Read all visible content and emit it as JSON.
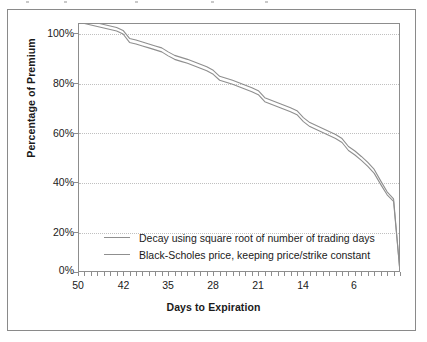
{
  "figure": {
    "border_color": "#8a8a8a",
    "background": "#ffffff"
  },
  "axes": {
    "y_title": "Percentage of Premium",
    "x_title": "Days to Expiration",
    "y_tick_labels": [
      "100%",
      "80%",
      "60%",
      "40%",
      "20%",
      "0%"
    ],
    "x_tick_labels": [
      "50",
      "42",
      "35",
      "28",
      "21",
      "14",
      "6"
    ],
    "grid_color": "#c0c0c0",
    "frame_color": "#8d8d8d"
  },
  "legend": {
    "items": [
      {
        "label": "Decay using square root of number of trading days",
        "color": "#8f8f8f"
      },
      {
        "label": "Black-Scholes price, keeping price/strike constant",
        "color": "#8f8f8f"
      }
    ]
  },
  "chart_data": {
    "type": "line",
    "title": "",
    "xlabel": "Days to Expiration",
    "ylabel": "Percentage of Premium",
    "xlim": [
      50,
      0
    ],
    "ylim": [
      0,
      100
    ],
    "grid": true,
    "x_axis_inverted": true,
    "legend_position": "inside-bottom-left",
    "y_ticks": [
      0,
      20,
      40,
      60,
      80,
      100
    ],
    "x_ticks": [
      50,
      42,
      35,
      28,
      21,
      14,
      6
    ],
    "x": [
      50,
      49,
      48,
      47,
      46,
      45,
      44,
      43,
      42,
      41,
      40,
      39,
      38,
      37,
      36,
      35,
      34,
      33,
      32,
      31,
      30,
      29,
      28,
      27,
      26,
      25,
      24,
      23,
      22,
      21,
      20,
      19,
      18,
      17,
      16,
      15,
      14,
      13,
      12,
      11,
      10,
      9,
      8,
      7,
      6,
      5,
      4,
      3,
      2,
      1,
      0
    ],
    "series": [
      {
        "name": "Decay using square root of number of trading days",
        "color": "#8f8f8f",
        "values": [
          101.8,
          101.2,
          100.6,
          100.0,
          99.4,
          98.8,
          98.2,
          97.0,
          93.8,
          93.2,
          92.4,
          91.6,
          90.8,
          90.0,
          88.4,
          87.0,
          86.2,
          85.4,
          84.4,
          83.4,
          82.4,
          81.0,
          78.6,
          77.8,
          77.0,
          76.0,
          75.0,
          74.0,
          72.8,
          70.0,
          69.0,
          68.0,
          67.0,
          66.0,
          64.8,
          62.0,
          60.0,
          58.8,
          57.6,
          56.4,
          55.2,
          53.6,
          50.4,
          48.6,
          46.4,
          44.0,
          41.2,
          36.6,
          32.2,
          29.4,
          0.0
        ]
      },
      {
        "name": "Black-Scholes price, keeping price/strike constant",
        "color": "#8f8f8f",
        "values": [
          100.4,
          99.8,
          99.2,
          98.6,
          98.0,
          97.4,
          96.8,
          95.6,
          92.2,
          91.6,
          90.8,
          90.0,
          89.2,
          88.4,
          86.8,
          85.4,
          84.6,
          83.8,
          82.8,
          81.8,
          80.8,
          79.4,
          77.0,
          76.2,
          75.4,
          74.4,
          73.4,
          72.4,
          71.2,
          68.4,
          67.4,
          66.4,
          65.4,
          64.4,
          63.2,
          60.4,
          58.4,
          57.2,
          56.0,
          54.8,
          53.6,
          52.0,
          48.8,
          47.0,
          44.8,
          42.4,
          39.6,
          35.2,
          31.0,
          28.4,
          0.0
        ]
      }
    ]
  }
}
